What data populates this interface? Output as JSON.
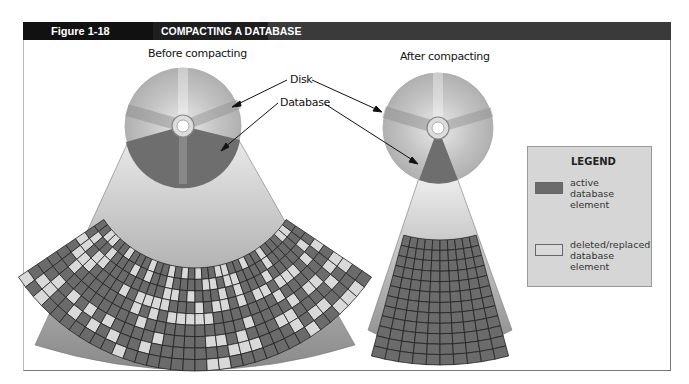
{
  "header": {
    "figure_label": "Figure 1-18",
    "title": "COMPACTING A DATABASE"
  },
  "diagram": {
    "before_caption": "Before compacting",
    "after_caption": "After compacting",
    "callouts": {
      "disk": "Disk",
      "database": "Database"
    }
  },
  "legend": {
    "title": "LEGEND",
    "items": [
      {
        "label_lines": [
          "active",
          "database",
          "element"
        ],
        "color": "#6b6b6b"
      },
      {
        "label_lines": [
          "deleted/replaced",
          "database",
          "element"
        ],
        "color": "#d9d9d9"
      }
    ]
  },
  "colors": {
    "active_cell": "#6b6b6b",
    "deleted_cell": "#d9d9d9",
    "grid_line": "#222222",
    "header_black": "#111111",
    "header_gray": "#3a3a3a"
  }
}
